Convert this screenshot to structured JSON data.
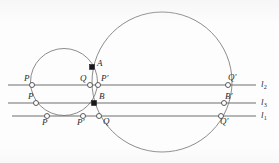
{
  "figure": {
    "kind": "euclidean-geometry-diagram",
    "canvas": {
      "width": 279,
      "height": 163
    },
    "background_color": "#fdfdfd",
    "line_color": "#6e6e70",
    "circle_color": "#77777a",
    "point_fill_color": "#18181a",
    "point_open_color": "#ffffff",
    "label_color": "#2a2a2c"
  },
  "lines": [
    {
      "id": "l2",
      "label": "l",
      "subscript": "2",
      "y": 85,
      "x_start": 8,
      "x_end": 256,
      "label_x": 261,
      "label_y": 80
    },
    {
      "id": "l3",
      "label": "l",
      "subscript": "3",
      "y": 103,
      "x_start": 8,
      "x_end": 256,
      "label_x": 261,
      "label_y": 98
    },
    {
      "id": "l1",
      "label": "l",
      "subscript": "1",
      "y": 116,
      "x_start": 12,
      "x_end": 256,
      "label_x": 261,
      "label_y": 111
    }
  ],
  "circles": [
    {
      "id": "small-circle",
      "cx": 64,
      "cy": 82,
      "r": 33.5
    },
    {
      "id": "large-circle",
      "cx": 162,
      "cy": 82,
      "r": 70.0
    }
  ],
  "points": [
    {
      "id": "A",
      "label": "A",
      "prime": false,
      "marker": "filled",
      "x": 92,
      "y": 67,
      "label_x": 97,
      "label_y": 59
    },
    {
      "id": "B",
      "label": "B",
      "prime": false,
      "marker": "filled",
      "x": 94,
      "y": 103,
      "label_x": 99,
      "label_y": 92
    },
    {
      "id": "P-l2",
      "label": "P",
      "prime": false,
      "marker": "open",
      "x": 32,
      "y": 85,
      "label_x": 24,
      "label_y": 74
    },
    {
      "id": "Q-l2",
      "label": "Q",
      "prime": false,
      "marker": "open",
      "x": 90,
      "y": 85,
      "label_x": 80,
      "label_y": 74
    },
    {
      "id": "Pp-l2",
      "label": "P",
      "prime": true,
      "marker": "open",
      "x": 98,
      "y": 85,
      "label_x": 101,
      "label_y": 74
    },
    {
      "id": "Qp-l2",
      "label": "Q",
      "prime": true,
      "marker": "open",
      "x": 228,
      "y": 85,
      "label_x": 228,
      "label_y": 73
    },
    {
      "id": "P-l3",
      "label": "P",
      "prime": false,
      "marker": "open",
      "x": 36,
      "y": 103,
      "label_x": 28,
      "label_y": 92
    },
    {
      "id": "Bp-l3",
      "label": "B",
      "prime": true,
      "marker": "open",
      "x": 224,
      "y": 103,
      "label_x": 225,
      "label_y": 92
    },
    {
      "id": "P-l1",
      "label": "P",
      "prime": false,
      "marker": "open",
      "x": 47,
      "y": 116,
      "label_x": 42,
      "label_y": 118
    },
    {
      "id": "Pp-l1",
      "label": "P",
      "prime": true,
      "marker": "open",
      "x": 83,
      "y": 116,
      "label_x": 77,
      "label_y": 118
    },
    {
      "id": "Q-l1",
      "label": "Q",
      "prime": false,
      "marker": "open",
      "x": 99,
      "y": 116,
      "label_x": 103,
      "label_y": 117
    },
    {
      "id": "Qp-l1",
      "label": "Q",
      "prime": true,
      "marker": "open",
      "x": 221,
      "y": 116,
      "label_x": 220,
      "label_y": 117
    }
  ]
}
